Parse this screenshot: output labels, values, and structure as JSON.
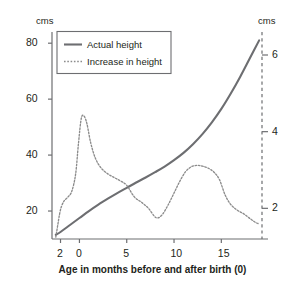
{
  "figure": {
    "background": "#ffffff",
    "ink_color": "#231f20",
    "line_color": "#6d6e71",
    "dotted_color": "#8c8c8c",
    "axis_color": "#6d6e71"
  },
  "axes": {
    "left": {
      "unit_label": "cms",
      "ticks": [
        20,
        40,
        60,
        80
      ],
      "tick_labels": [
        "20",
        "40",
        "60",
        "80"
      ],
      "range": [
        10,
        84
      ]
    },
    "right": {
      "unit_label": "cms",
      "ticks": [
        2,
        4,
        6
      ],
      "tick_labels": [
        "2",
        "4",
        "6"
      ],
      "range": [
        1.2,
        6.6
      ],
      "line_style": "dashed"
    },
    "bottom": {
      "title": "Age in months before and after birth (0)",
      "ticks": [
        -2,
        0,
        5,
        10,
        15
      ],
      "tick_labels": [
        "2",
        "0",
        "5",
        "10",
        "15"
      ],
      "range": [
        -2.9,
        19.3
      ]
    }
  },
  "legend": {
    "position": "top-left",
    "items": [
      {
        "label": "Actual height",
        "style": "solid"
      },
      {
        "label": "Increase in height",
        "style": "dotted"
      }
    ]
  },
  "chart_data": {
    "type": "line",
    "title": "",
    "subtitle": "",
    "xlabel": "Age in months before and after birth (0)",
    "ylabel": "cms",
    "y2label": "cms",
    "xlim": [
      -2.9,
      19.3
    ],
    "ylim": [
      10,
      84
    ],
    "y2lim": [
      1.2,
      6.6
    ],
    "grid": false,
    "legend_position": "top-left",
    "xticks": [
      -2,
      0,
      5,
      10,
      15
    ],
    "yticks": [
      20,
      40,
      60,
      80
    ],
    "y2ticks": [
      2,
      4,
      6
    ],
    "series": [
      {
        "name": "Actual height",
        "style": "solid",
        "axis": "left",
        "unit": "cms",
        "x": [
          -2.5,
          -2,
          -1,
          0,
          1,
          2,
          3,
          4,
          5,
          6,
          7,
          8,
          9,
          10,
          11,
          12,
          13,
          14,
          15,
          16,
          17,
          18,
          19
        ],
        "values": [
          11.5,
          12.5,
          15.0,
          17.5,
          20.0,
          22.3,
          24.4,
          26.4,
          28.3,
          30.2,
          32.0,
          33.9,
          35.9,
          38.2,
          40.8,
          43.9,
          47.5,
          51.7,
          56.5,
          62.0,
          68.0,
          74.5,
          81.0
        ]
      },
      {
        "name": "Increase in height",
        "style": "dotted",
        "axis": "right",
        "unit": "cms",
        "x": [
          -2.5,
          -2.3,
          -2.1,
          -1.9,
          -1.6,
          -1.2,
          -0.8,
          -0.4,
          -0.1,
          0.2,
          0.5,
          0.8,
          1.2,
          1.7,
          2.3,
          3.0,
          3.7,
          4.3,
          5.0,
          5.8,
          6.6,
          7.3,
          7.9,
          8.3,
          8.8,
          9.4,
          10.0,
          10.6,
          11.2,
          11.8,
          12.4,
          13.0,
          13.6,
          14.2,
          14.8,
          15.4,
          16.0,
          16.7,
          17.4,
          18.1,
          18.7,
          19.0
        ],
        "values": [
          1.25,
          1.55,
          1.85,
          2.05,
          2.2,
          2.3,
          2.45,
          2.9,
          3.7,
          4.35,
          4.4,
          4.2,
          3.7,
          3.3,
          3.05,
          2.9,
          2.8,
          2.72,
          2.6,
          2.3,
          2.15,
          2.0,
          1.8,
          1.75,
          1.85,
          2.1,
          2.4,
          2.7,
          2.95,
          3.08,
          3.12,
          3.1,
          3.05,
          2.95,
          2.75,
          2.35,
          2.1,
          1.95,
          1.85,
          1.72,
          1.62,
          1.6
        ]
      }
    ]
  }
}
